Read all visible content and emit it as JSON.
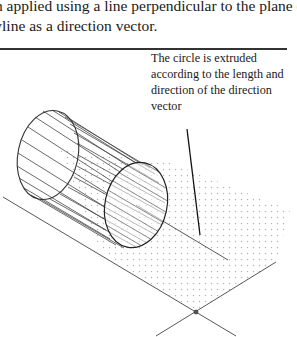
{
  "body_text": {
    "line1": "en applied using a line perpendicular to the plane of th",
    "line2": "lyline as a direction vector."
  },
  "annotation": {
    "text": "The circle is extruded according to the length and direction of the direction vector"
  },
  "figure": {
    "elements": [
      "back-circle",
      "front-circle",
      "generator-lines",
      "dotted-plane",
      "direction-vector-line",
      "axis-lines",
      "intersection-point",
      "leader-line"
    ]
  },
  "colors": {
    "line": "#333333",
    "dots": "#b8b8b8",
    "text": "#1a1a1a"
  }
}
